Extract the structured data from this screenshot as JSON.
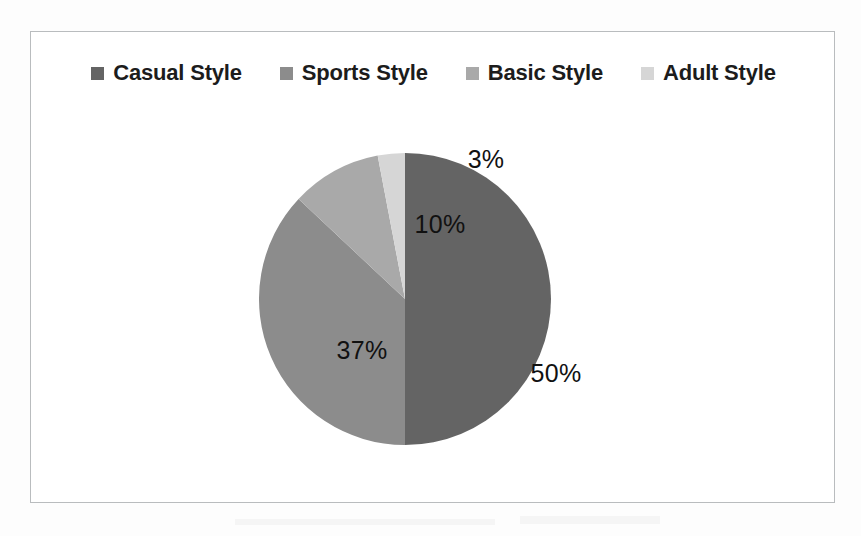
{
  "chart_data": {
    "type": "pie",
    "title": "",
    "subtitle": "",
    "xlabel": "",
    "ylabel": "",
    "grid": false,
    "legend_position": "top",
    "categories": [
      "Casual Style",
      "Sports Style",
      "Basic Style",
      "Adult Style"
    ],
    "values": [
      50,
      37,
      10,
      3
    ],
    "value_unit": "%",
    "data_labels": [
      "50%",
      "37%",
      "10%",
      "3%"
    ],
    "slice_colors": [
      "#646464",
      "#8c8c8c",
      "#a9a9a9",
      "#d6d6d6"
    ],
    "start_angle_deg": 0,
    "direction": "clockwise",
    "slices": [
      {
        "label": "Casual Style",
        "value": 50,
        "data_label": "50%",
        "color": "#646464"
      },
      {
        "label": "Sports Style",
        "value": 37,
        "data_label": "37%",
        "color": "#8c8c8c"
      },
      {
        "label": "Basic Style",
        "value": 10,
        "data_label": "10%",
        "color": "#a9a9a9"
      },
      {
        "label": "Adult Style",
        "value": 3,
        "data_label": "3%",
        "color": "#d6d6d6"
      }
    ]
  },
  "legend": {
    "items": [
      {
        "label": "Casual Style",
        "color": "#646464"
      },
      {
        "label": "Sports Style",
        "color": "#8c8c8c"
      },
      {
        "label": "Basic Style",
        "color": "#a9a9a9"
      },
      {
        "label": "Adult Style",
        "color": "#d6d6d6"
      }
    ]
  },
  "labels": {
    "casual": "50%",
    "sports": "37%",
    "basic": "10%",
    "adult": "3%"
  },
  "frame": {
    "border_color": "#b9bcbe",
    "background": "#ffffff"
  }
}
